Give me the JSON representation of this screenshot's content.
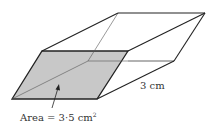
{
  "diagram": {
    "type": "prism",
    "labels": {
      "area": "Area = 3·5 cm",
      "area_superscript": "2",
      "length": "3 cm"
    },
    "colors": {
      "shaded_face": "#c8c8c8",
      "edge": "#222222",
      "hidden_edge": "#555555",
      "text": "#333333"
    },
    "vertices": {
      "front_bottom_left": [
        12,
        99
      ],
      "front_bottom_right": [
        97,
        99
      ],
      "front_top_right": [
        128,
        51
      ],
      "front_top_left": [
        42,
        51
      ],
      "back_bottom_left": [
        88,
        61
      ],
      "back_bottom_right": [
        174,
        61
      ],
      "back_top_right": [
        205,
        13
      ],
      "back_top_left": [
        118,
        13
      ]
    }
  }
}
